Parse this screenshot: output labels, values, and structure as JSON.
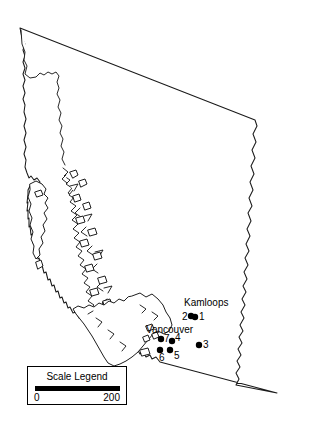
{
  "map": {
    "region_name": "British Columbia",
    "background_color": "#ffffff",
    "outline_color": "#1a1a1a",
    "marker_color": "#000000",
    "width": 309,
    "height": 446
  },
  "city_labels": [
    {
      "name": "Kamloops",
      "text": "Kamloops",
      "x": 184,
      "y": 298
    },
    {
      "name": "Vancouver",
      "text": "Vancouver",
      "x": 146,
      "y": 325
    }
  ],
  "sites": [
    {
      "id": "1",
      "label": "1",
      "dot_x": 195,
      "dot_y": 317,
      "label_x": 199,
      "label_y": 312
    },
    {
      "id": "2",
      "label": "2",
      "dot_x": 191,
      "dot_y": 316,
      "label_x": 182,
      "label_y": 312
    },
    {
      "id": "3",
      "label": "3",
      "dot_x": 199,
      "dot_y": 345,
      "label_x": 203,
      "label_y": 340
    },
    {
      "id": "4",
      "label": "4",
      "dot_x": 172,
      "dot_y": 341,
      "label_x": 175,
      "label_y": 333
    },
    {
      "id": "5",
      "label": "5",
      "dot_x": 170,
      "dot_y": 350,
      "label_x": 174,
      "label_y": 351
    },
    {
      "id": "6",
      "label": "6",
      "dot_x": 160,
      "dot_y": 350,
      "label_x": 159,
      "label_y": 353
    },
    {
      "id": "7",
      "label": "7",
      "dot_x": 161,
      "dot_y": 339,
      "label_x": 164,
      "label_y": 334
    }
  ],
  "scale_legend": {
    "title": "Scale Legend",
    "min_label": "0",
    "max_label": "200"
  }
}
